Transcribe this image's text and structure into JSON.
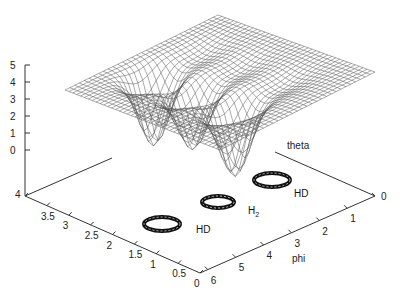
{
  "chart_data": {
    "type": "surface3d",
    "title": "",
    "axes": {
      "z": {
        "label": "",
        "ticks": [
          "5",
          "4",
          "3",
          "2",
          "1",
          "0"
        ],
        "range": [
          0,
          5
        ]
      },
      "theta": {
        "label": "theta",
        "ticks": [
          "4",
          "3.5",
          "3",
          "2.5",
          "2",
          "1.5",
          "1",
          "0.5",
          "0"
        ],
        "range": [
          0,
          4
        ]
      },
      "phi": {
        "label": "phi",
        "ticks": [
          "6",
          "5",
          "4",
          "3",
          "2",
          "1",
          "0"
        ],
        "range": [
          0,
          6.28
        ]
      }
    },
    "surface": {
      "description": "Wireframe potential surface, flat plateau near z≈4 with three deep wells",
      "plateau_z": 4,
      "wells": [
        {
          "label": "HD",
          "phi": 1.2,
          "theta": 1.4,
          "depth_z": 0
        },
        {
          "label": "H2",
          "phi": 3.1,
          "theta": 1.5,
          "depth_z": 0.2
        },
        {
          "label": "HD",
          "phi": 5.0,
          "theta": 1.4,
          "depth_z": 0
        }
      ]
    },
    "annotations": [
      {
        "text": "HD",
        "sub": "",
        "position": "upper-right ring"
      },
      {
        "text": "H",
        "sub": "2",
        "position": "middle ring"
      },
      {
        "text": "HD",
        "sub": "",
        "position": "lower-left ring"
      }
    ],
    "grid": false,
    "legend": null
  }
}
